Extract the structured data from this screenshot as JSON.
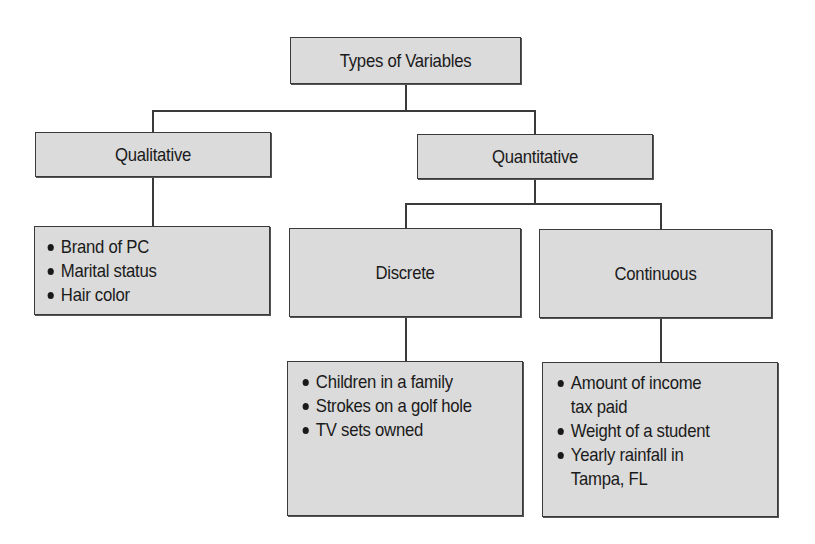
{
  "diagram": {
    "title": "Types of Variables",
    "root": {
      "label": "Types of Variables",
      "children": [
        {
          "label": "Qualitative",
          "examples": [
            "Brand of PC",
            "Marital status",
            "Hair color"
          ]
        },
        {
          "label": "Quantitative",
          "children": [
            {
              "label": "Discrete",
              "examples": [
                "Children in a family",
                "Strokes on a golf hole",
                "TV sets owned"
              ]
            },
            {
              "label": "Continuous",
              "examples": [
                "Amount of income tax paid",
                "Weight of a student",
                "Yearly rainfall in Tampa, FL"
              ]
            }
          ]
        }
      ]
    },
    "continuous_display_lines": [
      {
        "bullet": true,
        "text": "Amount of income"
      },
      {
        "bullet": false,
        "text": "tax paid"
      },
      {
        "bullet": true,
        "text": "Weight of a student"
      },
      {
        "bullet": true,
        "text": "Yearly rainfall in"
      },
      {
        "bullet": false,
        "text": "Tampa, FL"
      }
    ]
  },
  "colors": {
    "box_fill": "#dbdbdb",
    "box_border": "#3a3a3a",
    "text": "#1a1a1a",
    "background": "#ffffff"
  }
}
